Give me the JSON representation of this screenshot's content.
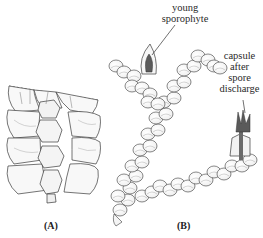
{
  "figure": {
    "panels": [
      {
        "id": "A",
        "label": "(A)"
      },
      {
        "id": "B",
        "label": "(B)"
      }
    ],
    "annotations": [
      {
        "text_lines": [
          "young",
          "sporophyte"
        ],
        "points_to": "young sporophyte emerging from perianth on upper branch"
      },
      {
        "text_lines": [
          "capsule",
          "after",
          "spore",
          "discharge"
        ],
        "points_to": "split capsule on right branch tip"
      }
    ],
    "colors": {
      "line": "#3a3a3a",
      "leaf_fill": "#f7f7f7",
      "leaf_shade": "#d9d9d9",
      "sporophyte": "#5a5a5a",
      "background": "#ffffff"
    }
  }
}
